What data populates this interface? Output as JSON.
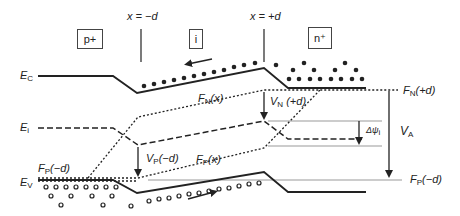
{
  "regions": {
    "p": "p+",
    "i": "i",
    "n": "n⁺"
  },
  "boundaries": {
    "left": "x = −d",
    "right": "x = +d"
  },
  "bands": {
    "ec": {
      "sym": "E",
      "sub": "C"
    },
    "ei": {
      "sym": "E",
      "sub": "i"
    },
    "ev": {
      "sym": "E",
      "sub": "V"
    }
  },
  "labels": {
    "fn_x": {
      "sym": "F",
      "sub": "N",
      "arg": "(x)"
    },
    "fp_x": {
      "sym": "F",
      "sub": "P",
      "arg": "(x)"
    },
    "fn_plus_d": {
      "sym": "F",
      "sub": "N",
      "arg": "(+d)"
    },
    "fp_minus_d_left": {
      "sym": "F",
      "sub": "P",
      "arg": "(−d)"
    },
    "fp_minus_d_right": {
      "sym": "F",
      "sub": "P",
      "arg": "(−d)"
    },
    "vn": {
      "sym": "V",
      "sub": "N",
      "arg": " (+d)"
    },
    "vp": {
      "sym": "V",
      "sub": "P",
      "arg": "(−d)"
    },
    "va": {
      "sym": "V",
      "sub": "A"
    },
    "dpsi": {
      "sym": "Δψ",
      "sub": "i"
    }
  },
  "colors": {
    "line": "#222222",
    "guide": "#999999"
  }
}
